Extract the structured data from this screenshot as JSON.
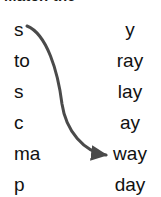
{
  "header": {
    "title": "Match the",
    "bullet_icon": "circle-icon"
  },
  "exercise": {
    "left_column": {
      "items": [
        {
          "label": "s"
        },
        {
          "label": "to"
        },
        {
          "label": "s"
        },
        {
          "label": "c"
        },
        {
          "label": "ma"
        },
        {
          "label": "p"
        }
      ]
    },
    "right_column": {
      "items": [
        {
          "label": "y"
        },
        {
          "label": "ray"
        },
        {
          "label": "lay"
        },
        {
          "label": "ay"
        },
        {
          "label": "way"
        },
        {
          "label": "day"
        }
      ]
    },
    "connections": [
      {
        "from_label": "s",
        "to_label": "way",
        "from_index": 0,
        "to_index": 4,
        "stroke_color": "#4a4a4a",
        "stroke_width": 3
      }
    ],
    "text_color": "#111111",
    "background_color": "#ffffff"
  }
}
